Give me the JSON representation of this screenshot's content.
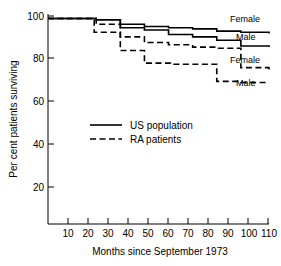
{
  "chart_data": {
    "type": "line",
    "subtype": "kaplan-meier-step",
    "title": "",
    "xlabel": "Months since September 1973",
    "ylabel": "Per cent patients surviving",
    "xlim": [
      0,
      110
    ],
    "ylim": [
      10,
      102
    ],
    "xticks": [
      10,
      20,
      30,
      40,
      50,
      60,
      70,
      80,
      90,
      100,
      110
    ],
    "xticklabels": [
      "10",
      "20",
      "30",
      "40",
      "50",
      "60",
      "70",
      "80",
      "90",
      "100",
      "110"
    ],
    "yticks": [
      20,
      40,
      60,
      80,
      100
    ],
    "yticklabels": [
      "20",
      "40",
      "60",
      "80",
      "100"
    ],
    "grid": false,
    "legend_position": "center-left",
    "legend": [
      {
        "label": "US population",
        "style": "solid"
      },
      {
        "label": "RA patients",
        "style": "dashed"
      }
    ],
    "series": [
      {
        "name": "US population Female",
        "group": "US population",
        "sex": "Female",
        "style": "solid",
        "end_label": "Female",
        "x": [
          0,
          12,
          24,
          36,
          48,
          60,
          72,
          84,
          96,
          110
        ],
        "y": [
          100,
          100,
          99.5,
          97.5,
          96.5,
          96,
          95.5,
          94.5,
          94,
          93.5
        ]
      },
      {
        "name": "US population Male",
        "group": "US population",
        "sex": "Male",
        "style": "solid",
        "end_label": "Male",
        "x": [
          0,
          12,
          24,
          36,
          48,
          60,
          72,
          84,
          96,
          110
        ],
        "y": [
          100,
          100,
          99.5,
          96,
          95,
          93,
          92,
          90.5,
          88,
          87.5
        ]
      },
      {
        "name": "RA patients Female",
        "group": "RA patients",
        "sex": "Female",
        "style": "dashed",
        "end_label": "Female",
        "x": [
          0,
          11,
          24,
          36,
          48,
          60,
          72,
          84,
          96,
          110
        ],
        "y": [
          100,
          100,
          97.5,
          92,
          89.5,
          88.5,
          87.5,
          87,
          78.5,
          77.5
        ]
      },
      {
        "name": "RA patients Male",
        "group": "RA patients",
        "sex": "Male",
        "style": "dashed",
        "end_label": "Male",
        "x": [
          0,
          11,
          23,
          36,
          48,
          61,
          84,
          96,
          110
        ],
        "y": [
          100,
          100,
          94,
          86,
          80.5,
          80,
          72.5,
          72,
          72
        ]
      }
    ]
  },
  "axis": {
    "y_title": "Per cent patients surviving",
    "x_title": "Months since September 1973"
  },
  "legend": {
    "us_population": "US population",
    "ra_patients": "RA patients"
  },
  "curve_labels": {
    "us_female": "Female",
    "us_male": "Male",
    "ra_female": "Female",
    "ra_male": "Male"
  },
  "yticklabels": {
    "t100": "100",
    "t80": "80",
    "t60": "60",
    "t40": "40",
    "t20": "20"
  },
  "xticklabels": {
    "t10": "10",
    "t20": "20",
    "t30": "30",
    "t40": "40",
    "t50": "50",
    "t60": "60",
    "t70": "70",
    "t80": "80",
    "t90": "90",
    "t100": "100",
    "t110": "110"
  },
  "colors": {
    "line": "#000000",
    "axis": "#000000",
    "background": "#ffffff"
  }
}
